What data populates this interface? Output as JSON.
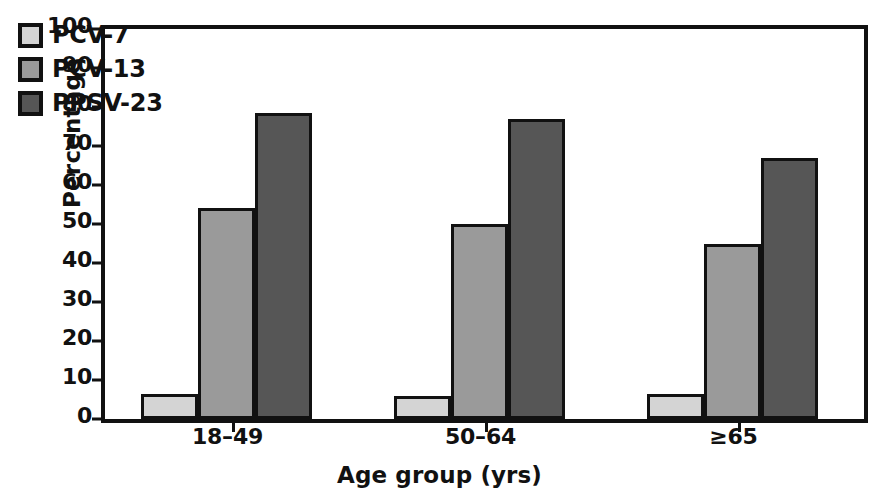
{
  "chart_data": {
    "type": "bar",
    "title": "",
    "xlabel": "Age group (yrs)",
    "ylabel": "Percentage",
    "categories": [
      "18–49",
      "50–64",
      "≥65"
    ],
    "series": [
      {
        "name": "PCV-7",
        "values": [
          6.5,
          6.0,
          6.5
        ],
        "color": "#d4d4d4"
      },
      {
        "name": "PCV-13",
        "values": [
          54.0,
          50.0,
          45.0
        ],
        "color": "#9a9a9a"
      },
      {
        "name": "PPSV-23",
        "values": [
          78.5,
          77.0,
          67.0
        ],
        "color": "#565656"
      }
    ],
    "ylim": [
      0,
      100
    ],
    "yticks": [
      0,
      10,
      20,
      30,
      40,
      50,
      60,
      70,
      80,
      90,
      100
    ],
    "ytick_labels": [
      "0",
      "10",
      "20",
      "30",
      "40",
      "50",
      "60",
      "70",
      "80",
      "90",
      "100"
    ],
    "grid": false,
    "legend_position": "upper-left",
    "axis_color": "#111111",
    "background": "#ffffff"
  },
  "legend": {
    "items": [
      {
        "label": "PCV-7",
        "color": "#d4d4d4"
      },
      {
        "label": "PCV-13",
        "color": "#9a9a9a"
      },
      {
        "label": "PPSV-23",
        "color": "#565656"
      }
    ]
  }
}
